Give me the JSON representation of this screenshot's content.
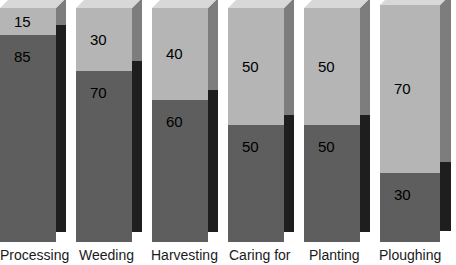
{
  "chart_data": {
    "type": "bar",
    "subtype": "stacked-3d-column",
    "title": "",
    "xlabel": "",
    "ylabel": "",
    "ylim": [
      0,
      100
    ],
    "grid": false,
    "legend": "none",
    "stacked": true,
    "categories": [
      "Processing",
      "Weeding",
      "Harvesting",
      "Caring for",
      "Planting",
      "Ploughing"
    ],
    "series": [
      {
        "name": "upper",
        "values": [
          15,
          30,
          40,
          50,
          50,
          70
        ]
      },
      {
        "name": "lower",
        "values": [
          85,
          70,
          60,
          50,
          50,
          30
        ]
      }
    ]
  },
  "colors": {
    "background": "#ffffff",
    "upper_front": "#b5b5b5",
    "upper_side": "#7d7d7d",
    "lower_front": "#5e5e5e",
    "lower_side": "#1e1e1e",
    "top_face": "#d8d8d8",
    "label_text": "#1a1a1a",
    "value_text": "#000000"
  },
  "bars": [
    {
      "category": "Processing",
      "upper_value": "15",
      "lower_value": "85",
      "x": 0,
      "width": 56,
      "depth": 10,
      "top": 8,
      "bottom": 242,
      "split": 35,
      "label_x": 0
    },
    {
      "category": "Weeding",
      "upper_value": "30",
      "lower_value": "70",
      "x": 76,
      "width": 56,
      "depth": 10,
      "top": 8,
      "bottom": 242,
      "split": 71,
      "label_x": 79
    },
    {
      "category": "Harvesting",
      "upper_value": "40",
      "lower_value": "60",
      "x": 152,
      "width": 56,
      "depth": 10,
      "top": 8,
      "bottom": 242,
      "split": 100,
      "label_x": 151
    },
    {
      "category": "Caring for",
      "upper_value": "50",
      "lower_value": "50",
      "x": 228,
      "width": 56,
      "depth": 10,
      "top": 8,
      "bottom": 242,
      "split": 125,
      "label_x": 229
    },
    {
      "category": "Planting",
      "upper_value": "50",
      "lower_value": "50",
      "x": 304,
      "width": 56,
      "depth": 10,
      "top": 8,
      "bottom": 242,
      "split": 125,
      "label_x": 309
    },
    {
      "category": "Ploughing",
      "upper_value": "70",
      "lower_value": "30",
      "x": 380,
      "width": 60,
      "depth": 11,
      "top": 5,
      "bottom": 242,
      "split": 173,
      "label_x": 379
    }
  ]
}
